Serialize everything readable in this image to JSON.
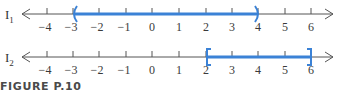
{
  "figure": {
    "caption": "FIGURE P.10",
    "axis_color": "#555555",
    "interval_color": "#3b82d6",
    "ticks": [
      "−4",
      "−3",
      "−2",
      "−1",
      "0",
      "1",
      "2",
      "3",
      "4",
      "5",
      "6"
    ],
    "lines": [
      {
        "label": "I",
        "subscript": "1",
        "interval": {
          "start": -3,
          "end": 4,
          "left_bracket": "(",
          "right_bracket": ")",
          "notation": "(-3, 4)"
        }
      },
      {
        "label": "I",
        "subscript": "2",
        "interval": {
          "start": 2,
          "end": 6,
          "left_bracket": "[",
          "right_bracket": "]",
          "notation": "[2, 6]"
        }
      }
    ]
  }
}
